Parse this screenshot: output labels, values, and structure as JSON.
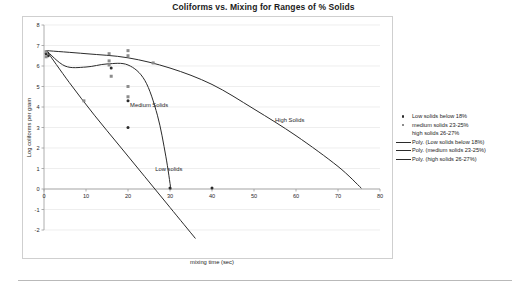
{
  "chart_data": {
    "type": "scatter",
    "title": "Coliforms vs. Mixing for Ranges of % Solids",
    "xlabel": "mixing time (sec)",
    "ylabel": "Log coliforms per gram",
    "xlim": [
      0,
      80
    ],
    "ylim": [
      -2,
      8
    ],
    "xticks": [
      "0",
      "10",
      "20",
      "30",
      "40",
      "50",
      "60",
      "70",
      "80"
    ],
    "xtick_values": [
      0,
      10,
      20,
      30,
      40,
      50,
      60,
      70,
      80
    ],
    "yticks": [
      "8",
      "7",
      "6",
      "5",
      "4",
      "3",
      "2",
      "1",
      "0",
      "-1",
      "-2"
    ],
    "ytick_values": [
      8,
      7,
      6,
      5,
      4,
      3,
      2,
      1,
      0,
      -1,
      -2
    ],
    "grid": true,
    "grid_axis": "y",
    "legend_position": "right",
    "series": [
      {
        "name": "Low solids below 18%",
        "marker": "circle",
        "color": "#2b2b2b",
        "points": [
          {
            "x": 0.5,
            "y": 6.6
          },
          {
            "x": 1.0,
            "y": 6.5
          },
          {
            "x": 16.0,
            "y": 5.9
          },
          {
            "x": 20.0,
            "y": 4.3
          },
          {
            "x": 20.0,
            "y": 3.0
          },
          {
            "x": 30.0,
            "y": 0.05
          },
          {
            "x": 40.0,
            "y": 0.05
          }
        ]
      },
      {
        "name": "medium solids 23-25%",
        "marker": "square",
        "color": "#8c8c8c",
        "points": [
          {
            "x": 0.5,
            "y": 6.7
          },
          {
            "x": 0.5,
            "y": 6.45
          },
          {
            "x": 9.5,
            "y": 4.3
          },
          {
            "x": 15.5,
            "y": 6.6
          },
          {
            "x": 15.5,
            "y": 6.25
          },
          {
            "x": 15.5,
            "y": 6.05
          },
          {
            "x": 16.0,
            "y": 5.5
          },
          {
            "x": 20.0,
            "y": 6.75
          },
          {
            "x": 20.0,
            "y": 6.5
          },
          {
            "x": 20.0,
            "y": 5.0
          },
          {
            "x": 20.0,
            "y": 4.5
          },
          {
            "x": 26.0,
            "y": 6.15
          }
        ]
      },
      {
        "name": "high solids 26-27%",
        "marker": "none",
        "color": "#8c8c8c",
        "points": []
      }
    ],
    "trendlines": [
      {
        "name": "Poly. (Low solids below 18%)",
        "color": "#2b2b2b",
        "path": [
          {
            "x": 0.6,
            "y": 6.75
          },
          {
            "x": 6.0,
            "y": 5.2
          },
          {
            "x": 12.0,
            "y": 3.6
          },
          {
            "x": 18.0,
            "y": 2.1
          },
          {
            "x": 24.0,
            "y": 0.6
          },
          {
            "x": 30.0,
            "y": -0.9
          },
          {
            "x": 36.0,
            "y": -2.4
          }
        ]
      },
      {
        "name": "Poly. (medium solids 23-25%)",
        "color": "#2b2b2b",
        "path": [
          {
            "x": 0.6,
            "y": 6.75
          },
          {
            "x": 5.0,
            "y": 6.0
          },
          {
            "x": 10.0,
            "y": 5.95
          },
          {
            "x": 15.0,
            "y": 6.1
          },
          {
            "x": 20.0,
            "y": 6.05
          },
          {
            "x": 24.0,
            "y": 5.3
          },
          {
            "x": 27.0,
            "y": 3.6
          },
          {
            "x": 29.0,
            "y": 1.6
          },
          {
            "x": 30.2,
            "y": 0.0
          }
        ]
      },
      {
        "name": "Poly. (high solids 26-27%)",
        "color": "#2b2b2b",
        "path": [
          {
            "x": 0.6,
            "y": 6.75
          },
          {
            "x": 10.0,
            "y": 6.6
          },
          {
            "x": 20.0,
            "y": 6.4
          },
          {
            "x": 30.0,
            "y": 5.9
          },
          {
            "x": 40.0,
            "y": 5.1
          },
          {
            "x": 50.0,
            "y": 3.9
          },
          {
            "x": 60.0,
            "y": 2.6
          },
          {
            "x": 70.0,
            "y": 1.1
          },
          {
            "x": 75.5,
            "y": 0.05
          }
        ]
      }
    ],
    "annotations": [
      {
        "text": "Medium Solids",
        "x": 20.5,
        "y": 4.05
      },
      {
        "text": "Low solids",
        "x": 26.5,
        "y": 0.95
      },
      {
        "text": "High Solids",
        "x": 55.0,
        "y": 3.3
      }
    ]
  },
  "legend": {
    "entries": [
      {
        "label": "Low solids below 18%",
        "key": "marker-circle"
      },
      {
        "label": "medium solids 23-25%",
        "key": "marker-square"
      },
      {
        "label": "high solids 26-27%",
        "key": "marker-none"
      },
      {
        "label": "Poly. (Low solids below 18%)",
        "key": "line"
      },
      {
        "label": "Poly. (medium solids 23-25%)",
        "key": "line"
      },
      {
        "label": "Poly. (high solids 26-27%)",
        "key": "line"
      }
    ]
  }
}
